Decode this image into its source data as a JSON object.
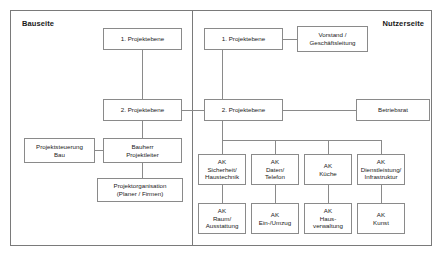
{
  "panels": {
    "left": {
      "title": "Bauseite"
    },
    "right": {
      "title": "Nutzerseite"
    }
  },
  "nodes": {
    "bau_ebene1": {
      "label": "1. Projektebene"
    },
    "bau_ebene2": {
      "label": "2. Projektebene"
    },
    "projektsteuerung": {
      "label": "Projektsteuerung\nBau"
    },
    "bauherr": {
      "label": "Bauherr\nProjektleiter"
    },
    "projektorganisation": {
      "label": "Projektorganisation\n(Planer / Firmen)"
    },
    "nutzer_ebene1": {
      "label": "1. Projektebene"
    },
    "vorstand": {
      "label": "Vorstand /\nGeschäftsleitung"
    },
    "nutzer_ebene2": {
      "label": "2. Projektebene"
    },
    "betriebsrat": {
      "label": "Betriebsrat"
    },
    "ak_sicherheit": {
      "label": "AK\nSicherheit/\nHaustechnik"
    },
    "ak_daten": {
      "label": "AK\nDaten/\nTelefon"
    },
    "ak_kueche": {
      "label": "AK\nKüche"
    },
    "ak_dienstleistung": {
      "label": "AK\nDienstleistung/\nInfrastruktur"
    },
    "ak_raum": {
      "label": "AK\nRaum/\nAusstattung"
    },
    "ak_umzug": {
      "label": "AK\nEin-/Umzug"
    },
    "ak_hausverwaltung": {
      "label": "AK\nHaus-\nverwaltung"
    },
    "ak_kunst": {
      "label": "AK\nKunst"
    }
  },
  "colors": {
    "border": "#7a7a7a",
    "box_border": "#8a8a8a",
    "line": "#8a8a8a",
    "text": "#1a1a1a",
    "background": "#ffffff"
  }
}
